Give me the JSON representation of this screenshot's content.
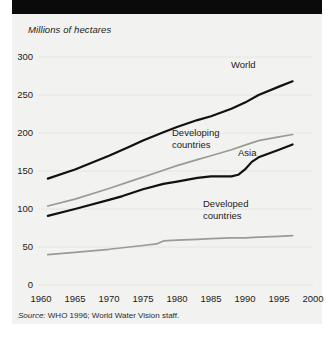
{
  "figure": {
    "background_color": "#f2f2f0",
    "header_bar_color": "#0a0a0a",
    "axis_title": "Millions of hectares",
    "source_prefix": "Source:",
    "source_text": " WHO 1996; World Water Vision staff."
  },
  "chart_data": {
    "type": "line",
    "title": "",
    "subtitle": "",
    "xlabel": "",
    "ylabel": "Millions of hectares",
    "xlim": [
      1960,
      2000
    ],
    "ylim": [
      0,
      300
    ],
    "xticks": [
      1960,
      1965,
      1970,
      1975,
      1980,
      1985,
      1990,
      1995,
      2000
    ],
    "yticks": [
      0,
      50,
      100,
      150,
      200,
      250,
      300
    ],
    "xtick_labels": [
      "1960",
      "1965",
      "1970",
      "1975",
      "1980",
      "1985",
      "1990",
      "1995",
      "2000"
    ],
    "ytick_labels": [
      "0",
      "50",
      "100",
      "150",
      "200",
      "250",
      "300"
    ],
    "grid": true,
    "grid_color": "#e2e2df",
    "legend": "inline-annotations",
    "series": [
      {
        "name": "World",
        "color": "#111111",
        "width": 2.2,
        "label_lines": [
          "World"
        ],
        "x": [
          1961,
          1965,
          1970,
          1973,
          1975,
          1978,
          1980,
          1983,
          1985,
          1988,
          1990,
          1992,
          1995,
          1997
        ],
        "values": [
          140,
          152,
          170,
          182,
          190,
          201,
          208,
          217,
          222,
          232,
          240,
          250,
          261,
          268
        ]
      },
      {
        "name": "Developing countries",
        "color": "#9a9a97",
        "width": 1.7,
        "label_lines": [
          "Developing",
          "countries"
        ],
        "x": [
          1961,
          1965,
          1970,
          1973,
          1975,
          1978,
          1980,
          1983,
          1985,
          1988,
          1990,
          1992,
          1995,
          1997
        ],
        "values": [
          104,
          113,
          127,
          136,
          142,
          151,
          157,
          165,
          170,
          178,
          184,
          190,
          195,
          198
        ]
      },
      {
        "name": "Asia",
        "color": "#111111",
        "width": 2.2,
        "label_lines": [
          "Asia"
        ],
        "x": [
          1961,
          1965,
          1970,
          1972,
          1973,
          1975,
          1978,
          1980,
          1983,
          1985,
          1988,
          1989,
          1990,
          1991,
          1992,
          1995,
          1997
        ],
        "values": [
          91,
          100,
          112,
          117,
          120,
          126,
          133,
          136,
          141,
          143,
          143,
          145,
          152,
          162,
          168,
          178,
          185
        ]
      },
      {
        "name": "Developed countries",
        "color": "#9a9a97",
        "width": 1.7,
        "label_lines": [
          "Developed",
          "countries"
        ],
        "x": [
          1961,
          1965,
          1970,
          1975,
          1977,
          1978,
          1980,
          1983,
          1985,
          1988,
          1990,
          1992,
          1995,
          1997
        ],
        "values": [
          40,
          43,
          47,
          52,
          54,
          58,
          59,
          60,
          61,
          62,
          62,
          63,
          64,
          65
        ]
      }
    ]
  }
}
